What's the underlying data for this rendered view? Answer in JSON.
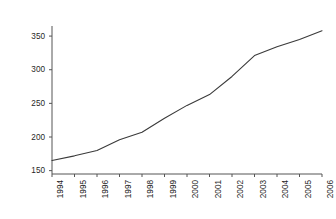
{
  "chart_data": {
    "type": "line",
    "title": "",
    "xlabel": "",
    "ylabel": "Incarcerated Population per 100,000 inhabitants",
    "x": [
      1994,
      1995,
      1996,
      1997,
      1998,
      1999,
      2000,
      2001,
      2002,
      2003,
      2004,
      2005,
      2006
    ],
    "categories": [
      "1994",
      "1995",
      "1996",
      "1997",
      "1998",
      "1999",
      "2000",
      "2001",
      "2002",
      "2003",
      "2004",
      "2005",
      "2006"
    ],
    "values": [
      165,
      172,
      180,
      196,
      207,
      228,
      247,
      263,
      290,
      321,
      334,
      345,
      358
    ],
    "series": [
      {
        "name": "Incarcerated Population per 100,000 inhabitants",
        "values": [
          165,
          172,
          180,
          196,
          207,
          228,
          247,
          263,
          290,
          321,
          334,
          345,
          358
        ]
      }
    ],
    "ylim": [
      145,
      365
    ],
    "xlim": [
      1994,
      2006
    ],
    "yticks": [
      150,
      200,
      250,
      300,
      350
    ],
    "ytick_labels": [
      "150",
      "200",
      "250",
      "300",
      "350"
    ],
    "xticks": [
      1994,
      1995,
      1996,
      1997,
      1998,
      1999,
      2000,
      2001,
      2002,
      2003,
      2004,
      2005,
      2006
    ],
    "xtick_labels": [
      "1994",
      "1995",
      "1996",
      "1997",
      "1998",
      "1999",
      "2000",
      "2001",
      "2002",
      "2003",
      "2004",
      "2005",
      "2006"
    ],
    "grid": false,
    "legend": false,
    "legend_position": "none",
    "line_color": "#3a3a3a",
    "axis_color": "#555555",
    "background_color": "#ffffff"
  }
}
